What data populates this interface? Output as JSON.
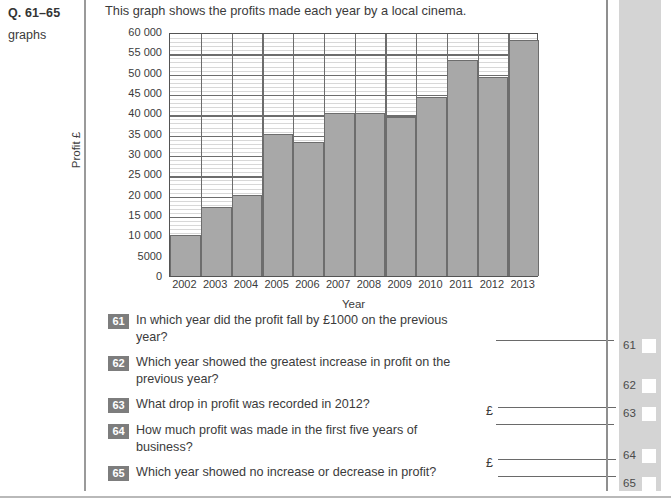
{
  "left_margin": {
    "question_range": "Q. 61–65",
    "topic": "graphs"
  },
  "intro_text": "This graph shows the profits made each year by a local cinema.",
  "chart_data": {
    "type": "bar",
    "title": "",
    "xlabel": "Year",
    "ylabel": "Profit £",
    "categories": [
      "2002",
      "2003",
      "2004",
      "2005",
      "2006",
      "2007",
      "2008",
      "2009",
      "2010",
      "2011",
      "2012",
      "2013"
    ],
    "values": [
      10000,
      17000,
      20000,
      35000,
      33000,
      40000,
      40000,
      39000,
      44000,
      53000,
      49000,
      58000
    ],
    "ylim": [
      0,
      60000
    ],
    "ytick_step": 5000,
    "minor_tick_step": 1000,
    "ytick_labels": [
      "60 000",
      "55 000",
      "50 000",
      "45 000",
      "40 000",
      "35 000",
      "30 000",
      "25 000",
      "20 000",
      "15 000",
      "10 000",
      "5000",
      "0"
    ],
    "ytick_values": [
      60000,
      55000,
      50000,
      45000,
      40000,
      35000,
      30000,
      25000,
      20000,
      15000,
      10000,
      5000,
      0
    ],
    "grid": true,
    "legend": "none",
    "bar_color": "#a8a8a8",
    "bar_border_color": "#6d6d6d",
    "gridline_major_color": "#6d6d6d",
    "gridline_minor_color": "#d8d8d8"
  },
  "questions": [
    {
      "number": "61",
      "text": "In which year did the profit fall by £1000 on the previous year?",
      "prefix": ""
    },
    {
      "number": "62",
      "text": "Which year showed the greatest increase in profit on the previous year?",
      "prefix": ""
    },
    {
      "number": "63",
      "text": "What drop in profit was recorded in 2012?",
      "prefix": "£"
    },
    {
      "number": "64",
      "text": "How much profit was made in the first five years of business?",
      "prefix": "£"
    },
    {
      "number": "65",
      "text": "Which year showed no increase or decrease in profit?",
      "prefix": ""
    }
  ],
  "answer_margin": {
    "items": [
      {
        "number": "61"
      },
      {
        "number": "62"
      },
      {
        "number": "63"
      },
      {
        "number": "64"
      },
      {
        "number": "65"
      }
    ]
  }
}
